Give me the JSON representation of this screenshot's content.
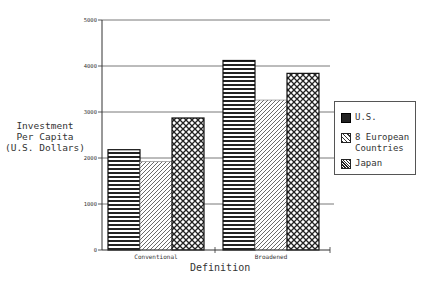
{
  "chart_data": {
    "type": "bar",
    "title": "",
    "xlabel": "Definition",
    "ylabel": "Investment Per Capita (U.S. Dollars)",
    "ylabel_lines": [
      "Investment",
      "Per Capita",
      "(U.S. Dollars)"
    ],
    "categories": [
      "Conventional",
      "Broadened"
    ],
    "series": [
      {
        "name": "U.S.",
        "pattern": "horizontal-lines",
        "values": [
          2180,
          4120
        ]
      },
      {
        "name": "8 European Countries",
        "pattern": "diagonal-lines",
        "values": [
          1920,
          3260
        ]
      },
      {
        "name": "Japan",
        "pattern": "crosshatch-dots",
        "values": [
          2870,
          3840
        ]
      }
    ],
    "ylim": [
      0,
      5000
    ],
    "yticks": [
      0,
      1000,
      2000,
      3000,
      4000,
      5000
    ],
    "ytick_labels": [
      "0",
      "1000",
      "2000",
      "3000",
      "4000",
      "5000"
    ],
    "grid": true,
    "legend_position": "right"
  },
  "legend": {
    "items": [
      {
        "label_lines": [
          "U.S."
        ]
      },
      {
        "label_lines": [
          "8 European",
          "Countries"
        ]
      },
      {
        "label_lines": [
          "Japan"
        ]
      }
    ]
  }
}
